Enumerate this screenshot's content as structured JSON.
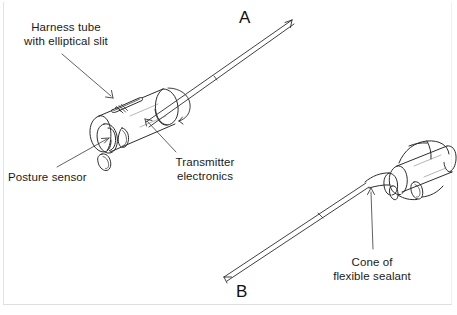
{
  "figure": {
    "type": "technical-line-diagram",
    "background_color": "#ffffff",
    "ink_color": "#2b2b2b"
  },
  "labels": [
    {
      "id": "harness-tube",
      "line1": "Harness tube",
      "line2": "with elliptical slit"
    },
    {
      "id": "posture-sensor",
      "line1": "Posture sensor",
      "line2": ""
    },
    {
      "id": "transmitter-electronics",
      "line1": "Transmitter",
      "line2": "electronics"
    },
    {
      "id": "cone-of-sealant",
      "line1": "Cone of",
      "line2": "flexible sealant"
    }
  ],
  "view_letters": [
    {
      "id": "view-a",
      "text": "A"
    },
    {
      "id": "view-b",
      "text": "B"
    }
  ]
}
